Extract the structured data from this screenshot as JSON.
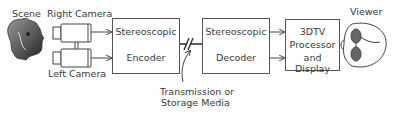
{
  "diagram": {
    "scene_label": "Scene",
    "right_camera_label": "Right Camera",
    "left_camera_label": "Left Camera",
    "encoder": {
      "line1": "Stereoscopic",
      "line2": "Encoder"
    },
    "decoder": {
      "line1": "Stereoscopic",
      "line2": "Decoder"
    },
    "display": {
      "line1": "3DTV",
      "line2": "Processor",
      "line3": "and Display"
    },
    "viewer_label": "Viewer",
    "transmission_label": {
      "line1": "Transmission or",
      "line2": "Storage Media"
    }
  }
}
